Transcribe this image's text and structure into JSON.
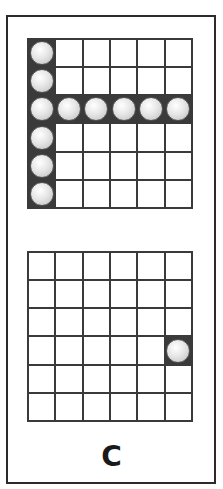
{
  "figure": {
    "label": "C",
    "grid_size": {
      "rows": 6,
      "cols": 6
    },
    "colors": {
      "border": "#2b2b2b",
      "grid_line": "#3a3a3a",
      "ball": "#e6e6e6",
      "background": "#ffffff"
    },
    "top_grid": {
      "balls": [
        [
          0,
          0
        ],
        [
          1,
          0
        ],
        [
          2,
          0
        ],
        [
          2,
          1
        ],
        [
          2,
          2
        ],
        [
          2,
          3
        ],
        [
          2,
          4
        ],
        [
          2,
          5
        ],
        [
          3,
          0
        ],
        [
          4,
          0
        ],
        [
          5,
          0
        ]
      ]
    },
    "bottom_grid": {
      "balls": [
        [
          3,
          5
        ]
      ]
    }
  }
}
